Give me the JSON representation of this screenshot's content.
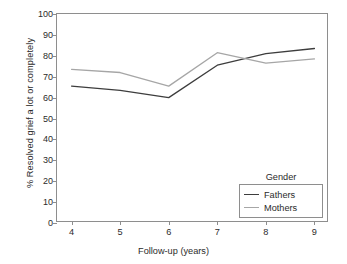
{
  "chart_data": {
    "type": "line",
    "title": "",
    "xlabel": "Follow-up (years)",
    "ylabel": "% Resolved grief a lot or completely",
    "x": [
      4,
      5,
      6,
      7,
      8,
      9
    ],
    "xtick_labels": [
      "4",
      "5",
      "6",
      "7",
      "8",
      "9"
    ],
    "xlim": [
      3.7,
      9.3
    ],
    "ylim": [
      0,
      100
    ],
    "ytick_labels": [
      "0",
      "10",
      "20",
      "30",
      "40",
      "50",
      "60",
      "70",
      "80",
      "90",
      "100"
    ],
    "yticks": [
      0,
      10,
      20,
      30,
      40,
      50,
      60,
      70,
      80,
      90,
      100
    ],
    "grid": false,
    "legend_position": "lower-right",
    "legend_title": "Gender",
    "series": [
      {
        "name": "Fathers",
        "color": "#3d3d3d",
        "values": [
          65.5,
          63.5,
          60.0,
          75.5,
          81.0,
          83.5
        ]
      },
      {
        "name": "Mothers",
        "color": "#a6a6a6",
        "values": [
          73.5,
          72.0,
          65.5,
          81.5,
          76.5,
          78.5
        ]
      }
    ]
  },
  "axes": {
    "frame_color": "#8e8e8e",
    "text_color": "#2b2b2b"
  }
}
